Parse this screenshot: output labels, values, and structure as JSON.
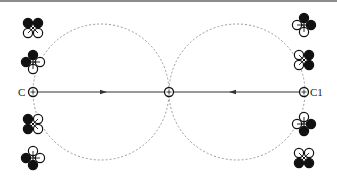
{
  "diagram": {
    "type": "formation-trajectory",
    "colors": {
      "line": "#333333",
      "dashed_circle": "#9a9a9a",
      "rotor_filled": "#111111",
      "rotor_open": "#ffffff",
      "border": "#555555"
    },
    "circles": [
      {
        "name": "left-circle",
        "cx": 101,
        "cy": 92,
        "r": 68
      },
      {
        "name": "right-circle",
        "cx": 237,
        "cy": 92,
        "r": 68
      }
    ],
    "points": [
      {
        "name": "point-c",
        "label": "C",
        "x": 33,
        "y": 92
      },
      {
        "name": "point-center",
        "label": "",
        "x": 169,
        "y": 92
      },
      {
        "name": "point-c1",
        "label": "C1",
        "x": 304,
        "y": 92
      }
    ],
    "labels": {
      "c": "C",
      "c1": "C1"
    },
    "arrows": [
      {
        "name": "arrow-right",
        "x": 103,
        "y": 92,
        "direction": "right"
      },
      {
        "name": "arrow-left",
        "x": 233,
        "y": 92,
        "direction": "left"
      }
    ],
    "drones": [
      {
        "name": "drone-left-1",
        "x": 33,
        "y": 28,
        "config": "x",
        "filled": [
          "tl",
          "tr"
        ]
      },
      {
        "name": "drone-left-2",
        "x": 33,
        "y": 62,
        "config": "plus",
        "filled": [
          "t",
          "l"
        ]
      },
      {
        "name": "drone-left-3",
        "x": 33,
        "y": 124,
        "config": "x",
        "filled": [
          "tl",
          "bl"
        ]
      },
      {
        "name": "drone-left-4",
        "x": 33,
        "y": 158,
        "config": "plus",
        "filled": [
          "l",
          "b"
        ]
      },
      {
        "name": "drone-right-1",
        "x": 304,
        "y": 25,
        "config": "plus",
        "filled": [
          "t",
          "r"
        ]
      },
      {
        "name": "drone-right-2",
        "x": 304,
        "y": 60,
        "config": "x",
        "filled": [
          "tr",
          "br"
        ]
      },
      {
        "name": "drone-right-3",
        "x": 304,
        "y": 124,
        "config": "plus",
        "filled": [
          "r",
          "b"
        ]
      },
      {
        "name": "drone-right-4",
        "x": 304,
        "y": 158,
        "config": "x",
        "filled": [
          "bl",
          "br"
        ]
      }
    ]
  }
}
